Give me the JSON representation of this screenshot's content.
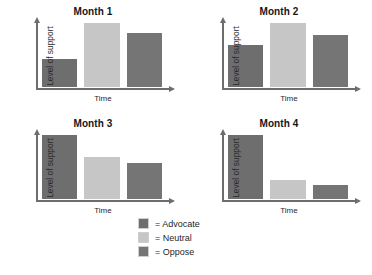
{
  "colors": {
    "advocate": "#6e6e6e",
    "neutral": "#c6c6c6",
    "oppose": "#757575",
    "axis": "#6d6d6d",
    "background": "#ffffff"
  },
  "legend": {
    "items": [
      {
        "label": "= Advocate",
        "key": "advocate",
        "color": "#6e6e6e"
      },
      {
        "label": "= Neutral",
        "key": "neutral",
        "color": "#c6c6c6"
      },
      {
        "label": "= Oppose",
        "key": "oppose",
        "color": "#757575"
      }
    ]
  },
  "chart_data": [
    {
      "type": "bar",
      "title": "Month 1",
      "xlabel": "Time",
      "ylabel": "Level of support",
      "categories": [
        "Advocate",
        "Neutral",
        "Oppose"
      ],
      "values": [
        46,
        100,
        85
      ],
      "ylim": [
        0,
        100
      ],
      "grid": false,
      "legend_position": "bottom-center",
      "bar_colors": [
        "#6e6e6e",
        "#c6c6c6",
        "#757575"
      ]
    },
    {
      "type": "bar",
      "title": "Month 2",
      "xlabel": "Time",
      "ylabel": "Level of support",
      "categories": [
        "Advocate",
        "Neutral",
        "Oppose"
      ],
      "values": [
        68,
        100,
        82
      ],
      "ylim": [
        0,
        100
      ],
      "grid": false,
      "legend_position": "bottom-center",
      "bar_colors": [
        "#6e6e6e",
        "#c6c6c6",
        "#757575"
      ]
    },
    {
      "type": "bar",
      "title": "Month 3",
      "xlabel": "Time",
      "ylabel": "Level of support",
      "categories": [
        "Advocate",
        "Neutral",
        "Oppose"
      ],
      "values": [
        100,
        68,
        58
      ],
      "ylim": [
        0,
        100
      ],
      "grid": false,
      "legend_position": "bottom-center",
      "bar_colors": [
        "#6e6e6e",
        "#c6c6c6",
        "#757575"
      ]
    },
    {
      "type": "bar",
      "title": "Month 4",
      "xlabel": "Time",
      "ylabel": "Level of support",
      "categories": [
        "Advocate",
        "Neutral",
        "Oppose"
      ],
      "values": [
        100,
        33,
        25
      ],
      "ylim": [
        0,
        100
      ],
      "grid": false,
      "legend_position": "bottom-center",
      "bar_colors": [
        "#6e6e6e",
        "#c6c6c6",
        "#757575"
      ]
    }
  ]
}
